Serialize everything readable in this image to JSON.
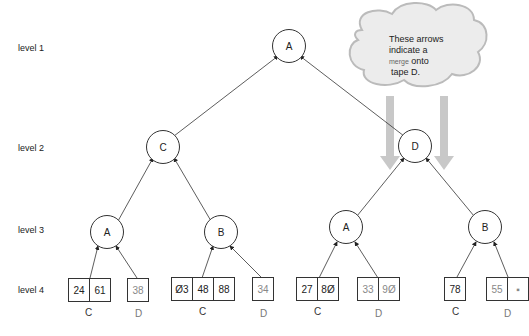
{
  "levels": [
    {
      "label": "level 1",
      "y": 48
    },
    {
      "label": "level 2",
      "y": 144
    },
    {
      "label": "level 3",
      "y": 226
    },
    {
      "label": "level 4",
      "y": 284
    }
  ],
  "tree_nodes": [
    {
      "id": "L1",
      "label": "A",
      "x": 289,
      "y": 46
    },
    {
      "id": "L2a",
      "label": "C",
      "x": 163,
      "y": 147
    },
    {
      "id": "L2b",
      "label": "D",
      "x": 415,
      "y": 146
    },
    {
      "id": "L3a",
      "label": "A",
      "x": 107,
      "y": 232
    },
    {
      "id": "L3b",
      "label": "B",
      "x": 221,
      "y": 232
    },
    {
      "id": "L3c",
      "label": "A",
      "x": 346,
      "y": 227
    },
    {
      "id": "L3d",
      "label": "B",
      "x": 485,
      "y": 227
    }
  ],
  "edges": [
    [
      "L2a",
      "L1"
    ],
    [
      "L2b",
      "L1"
    ],
    [
      "L3a",
      "L2a"
    ],
    [
      "L3b",
      "L2a"
    ],
    [
      "L3c",
      "L2b"
    ],
    [
      "L3d",
      "L2b"
    ]
  ],
  "runs": [
    {
      "tape": "C",
      "values": [
        "24",
        "61"
      ],
      "faded": false,
      "x": 68
    },
    {
      "tape": "D",
      "values": [
        "38"
      ],
      "faded": true,
      "x": 127
    },
    {
      "tape": "C",
      "values": [
        "Ø3",
        "48",
        "88"
      ],
      "faded": false,
      "x": 171
    },
    {
      "tape": "D",
      "values": [
        "34"
      ],
      "faded": true,
      "x": 252
    },
    {
      "tape": "C",
      "values": [
        "27",
        "8Ø"
      ],
      "faded": false,
      "x": 296
    },
    {
      "tape": "D",
      "values": [
        "33",
        "9Ø"
      ],
      "faded": true,
      "x": 357
    },
    {
      "tape": "C",
      "values": [
        "78"
      ],
      "faded": false,
      "x": 444
    },
    {
      "tape": "D",
      "values": [
        "55",
        "▪"
      ],
      "faded": true,
      "x": 486
    }
  ],
  "callout": {
    "line1": "These arrows",
    "line2": "indicate a",
    "line3_small": "merge",
    "line3_rest": " onto",
    "line4": "tape D."
  },
  "colors": {
    "line": "#333333",
    "cloud_fill": "#ececec",
    "cloud_border": "#bbbbbb",
    "merge_arrow": "#c8c8c8"
  }
}
